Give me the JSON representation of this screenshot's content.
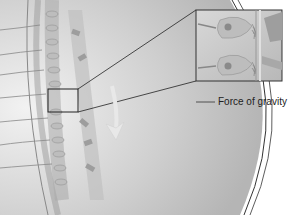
{
  "diagram": {
    "label": "Force of gravity",
    "inset": "magnified hair cells with otoliths",
    "colors": {
      "background": "#ffffff",
      "tissue": "#cfcfcf",
      "tissue_dark": "#a9a9a9",
      "line": "#333333",
      "arrow": "#e6e6e6"
    }
  }
}
